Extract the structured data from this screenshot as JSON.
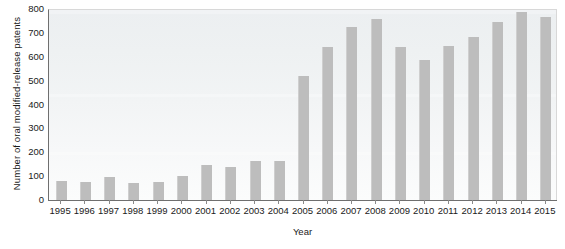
{
  "chart_data": {
    "type": "bar",
    "title": "",
    "xlabel": "Year",
    "ylabel": "Number of oral modified-release patents",
    "categories": [
      "1995",
      "1996",
      "1997",
      "1998",
      "1999",
      "2000",
      "2001",
      "2002",
      "2003",
      "2004",
      "2005",
      "2006",
      "2007",
      "2008",
      "2009",
      "2010",
      "2011",
      "2012",
      "2013",
      "2014",
      "2015"
    ],
    "values": [
      78,
      75,
      95,
      70,
      75,
      100,
      145,
      140,
      163,
      163,
      518,
      640,
      725,
      757,
      642,
      588,
      645,
      682,
      745,
      787,
      768
    ],
    "ylim": [
      0,
      800
    ],
    "yticks": [
      0,
      100,
      200,
      300,
      400,
      500,
      600,
      700,
      800
    ],
    "ytick_labels": [
      "0",
      "100",
      "200",
      "300",
      "400",
      "500",
      "600",
      "700",
      "800"
    ],
    "grid": false,
    "legend": null,
    "bar_color": "#bdbdbd",
    "axis_color": "#6f6f6f",
    "plot_background": "#eef1f2"
  },
  "axes": {
    "y_title": "Number of oral modified-release patents",
    "x_title": "Year"
  }
}
